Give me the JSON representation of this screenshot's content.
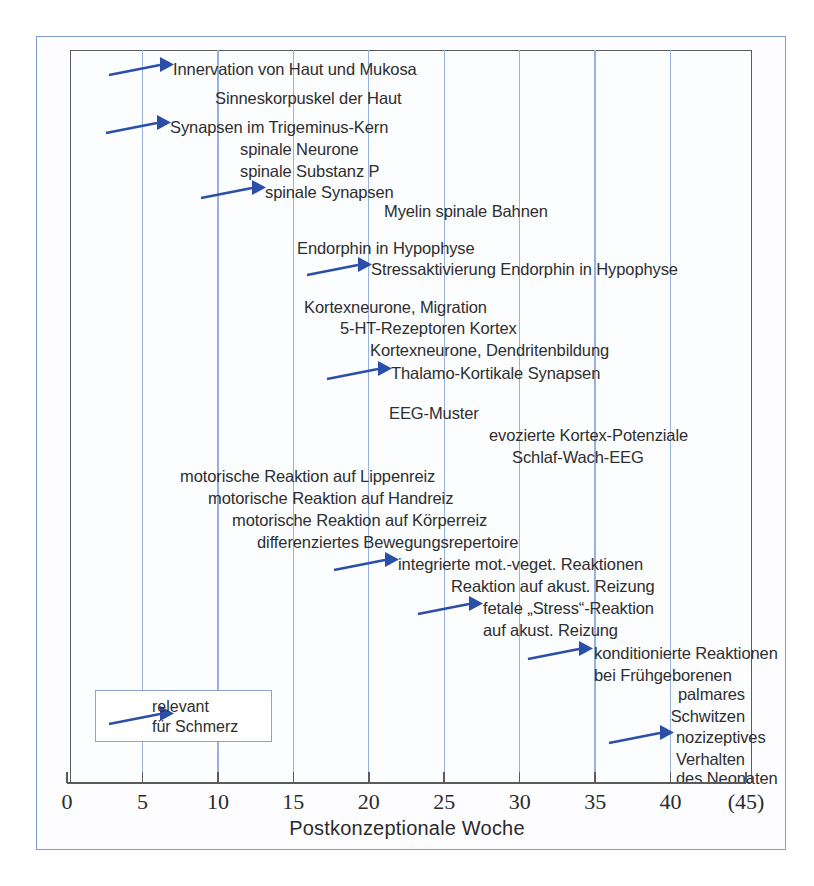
{
  "chart_data": {
    "type": "timeline",
    "title": "",
    "xlabel": "Postkonzeptionale Woche",
    "xlim": [
      0,
      45
    ],
    "xticks": [
      0,
      5,
      10,
      15,
      20,
      25,
      30,
      35,
      40
    ],
    "xtick_labels": [
      "0",
      "5",
      "10",
      "15",
      "20",
      "25",
      "30",
      "35",
      "40",
      "(45)"
    ],
    "xtick_end_label": "(45)",
    "grid": "vertical",
    "legend": {
      "position": "bottom-left",
      "arrow_label": "relevant\nfür Schmerz",
      "arrow_color": "#2b4ea8"
    },
    "events": [
      {
        "label": "Innervation von Haut und Mukosa",
        "week_start": 7,
        "pain_relevant": true
      },
      {
        "label": "Sinneskorpuskel der Haut",
        "week_start": 10,
        "pain_relevant": false
      },
      {
        "label": "Synapsen im Trigeminus-Kern",
        "week_start": 7,
        "pain_relevant": true
      },
      {
        "label": "spinale Neurone",
        "week_start": 11,
        "pain_relevant": false
      },
      {
        "label": "spinale Substanz P",
        "week_start": 11,
        "pain_relevant": false
      },
      {
        "label": "spinale Synapsen",
        "week_start": 13,
        "pain_relevant": true
      },
      {
        "label": "Myelin spinale Bahnen",
        "week_start": 20,
        "pain_relevant": false
      },
      {
        "label": "Endorphin in Hypophyse",
        "week_start": 15,
        "pain_relevant": false
      },
      {
        "label": "Stressaktivierung Endorphin in Hypophyse",
        "week_start": 20,
        "pain_relevant": true
      },
      {
        "label": "Kortexneurone, Migration",
        "week_start": 15,
        "pain_relevant": false
      },
      {
        "label": "5-HT-Rezeptoren Kortex",
        "week_start": 18,
        "pain_relevant": false
      },
      {
        "label": "Kortexneurone, Dendritenbildung",
        "week_start": 20,
        "pain_relevant": false
      },
      {
        "label": "Thalamo-Kortikale Synapsen",
        "week_start": 23,
        "pain_relevant": true
      },
      {
        "label": "EEG-Muster",
        "week_start": 21,
        "pain_relevant": false
      },
      {
        "label": "evozierte Kortex-Potenziale",
        "week_start": 30,
        "pain_relevant": false
      },
      {
        "label": "Schlaf-Wach-EEG",
        "week_start": 31,
        "pain_relevant": false
      },
      {
        "label": "motorische Reaktion auf Lippenreiz",
        "week_start": 8,
        "pain_relevant": false
      },
      {
        "label": "motorische Reaktion auf Handreiz",
        "week_start": 10,
        "pain_relevant": false
      },
      {
        "label": "motorische Reaktion auf Körperreiz",
        "week_start": 12,
        "pain_relevant": false
      },
      {
        "label": "differenziertes Bewegungsrepertoire",
        "week_start": 14,
        "pain_relevant": false
      },
      {
        "label": "integrierte mot.-veget. Reaktionen",
        "week_start": 24,
        "pain_relevant": true
      },
      {
        "label": "Reaktion auf akust. Reizung",
        "week_start": 25,
        "pain_relevant": false
      },
      {
        "label": "fetale „Stress\"-Reaktion\nauf akust. Reizung",
        "week_start": 28,
        "pain_relevant": true
      },
      {
        "label": "konditionierte Reaktionen\nbei Frühgeborenen",
        "week_start": 33,
        "pain_relevant": true
      },
      {
        "label": "palmares\nSchwitzen",
        "week_start": 41,
        "pain_relevant": false
      },
      {
        "label": "nozizeptives\nVerhalten\ndes Neonaten",
        "week_start": 41,
        "pain_relevant": true
      }
    ]
  },
  "axis": {
    "title": "Postkonzeptionale Woche",
    "ticks": [
      {
        "value": "0",
        "week": 0
      },
      {
        "value": "5",
        "week": 5
      },
      {
        "value": "10",
        "week": 10
      },
      {
        "value": "15",
        "week": 15
      },
      {
        "value": "20",
        "week": 20
      },
      {
        "value": "25",
        "week": 25
      },
      {
        "value": "30",
        "week": 30
      },
      {
        "value": "35",
        "week": 35
      },
      {
        "value": "40",
        "week": 40
      },
      {
        "value": "(45)",
        "week": 45
      }
    ]
  },
  "labels": {
    "l01": "Innervation von Haut und Mukosa",
    "l02": "Sinneskorpuskel der Haut",
    "l03": "Synapsen im Trigeminus-Kern",
    "l04": "spinale Neurone",
    "l05": "spinale Substanz P",
    "l06": "spinale Synapsen",
    "l07": "Myelin spinale Bahnen",
    "l08": "Endorphin in Hypophyse",
    "l09": "Stressaktivierung Endorphin in Hypophyse",
    "l10": "Kortexneurone, Migration",
    "l11": "5-HT-Rezeptoren Kortex",
    "l12": "Kortexneurone, Dendritenbildung",
    "l13": "Thalamo-Kortikale Synapsen",
    "l14": "EEG-Muster",
    "l15": "evozierte Kortex-Potenziale",
    "l16": "Schlaf-Wach-EEG",
    "l17": "motorische Reaktion auf Lippenreiz",
    "l18": "motorische Reaktion auf Handreiz",
    "l19": "motorische Reaktion auf Körperreiz",
    "l20": "differenziertes Bewegungsrepertoire",
    "l21": "integrierte mot.-veget. Reaktionen",
    "l22": "Reaktion auf akust. Reizung",
    "l23a": "fetale „Stress“-Reaktion",
    "l23b": "auf akust. Reizung",
    "l24a": "konditionierte Reaktionen",
    "l24b": "bei Frühgeborenen",
    "l25a": "palmares",
    "l25b": "Schwitzen",
    "l26a": "nozizeptives",
    "l26b": "Verhalten",
    "l26c": "des Neonaten"
  },
  "legend": {
    "text": "relevant\nfür Schmerz"
  },
  "colors": {
    "arrow": "#2b4ea8",
    "gridline": "#96b2dd",
    "frame": "#5b5b5b",
    "outer_border": "#7e9ccc",
    "text": "#2e2e2e"
  }
}
